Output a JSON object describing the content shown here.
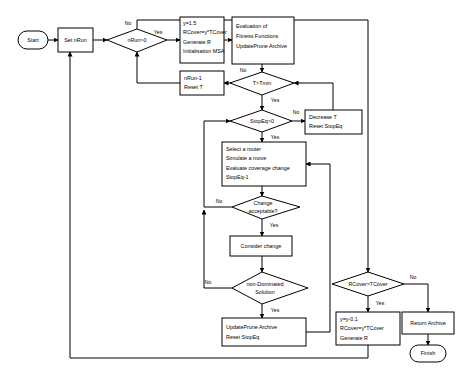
{
  "diagram": {
    "background_color": "#ffffff",
    "line_color": "#000000",
    "node_fill": "#ffffff",
    "nodes": {
      "start": {
        "label": "Start",
        "type": "terminator"
      },
      "set_nrun": {
        "label": "Set nRun",
        "type": "process"
      },
      "nrun_gt_0": {
        "label": "nRun>0",
        "type": "decision"
      },
      "init_box": {
        "type": "process",
        "lines": [
          "y=1.5",
          "RCover=y*TCover",
          "Generate R",
          "Initialisation MSA"
        ]
      },
      "eval_box": {
        "type": "process",
        "lines": [
          "Evaluation of",
          "Fitness Functions",
          "UpdatePrune Archive"
        ]
      },
      "nrun_dec": {
        "type": "process",
        "lines": [
          "nRun-1",
          "Reset T"
        ]
      },
      "t_gt_tmin": {
        "label": "T>Tmin",
        "type": "decision"
      },
      "decrease_t": {
        "type": "process",
        "lines": [
          "Decrease T",
          "Reset StopEq"
        ]
      },
      "stopeq_gt_0": {
        "label": "StopEq>0",
        "type": "decision"
      },
      "select_router": {
        "type": "process",
        "lines": [
          "Select a router",
          "Simulate a move",
          "Evaluate coverage change",
          "StopEq-1"
        ]
      },
      "change_acceptable": {
        "type": "decision",
        "lines": [
          "Change",
          "acceptable?"
        ]
      },
      "consider_change": {
        "label": "Consider change",
        "type": "process"
      },
      "non_dominated": {
        "type": "decision",
        "lines": [
          "non-Dominated",
          "Solution"
        ]
      },
      "update_prune": {
        "type": "process",
        "lines": [
          "UpdatePrune Archive",
          "Reset StopEq"
        ]
      },
      "rcover_gt_tcover": {
        "label": "RCover>TCover",
        "type": "decision"
      },
      "decrease_y": {
        "type": "process",
        "lines": [
          "y=y-0.1",
          "RCover=y*TCover",
          "Generate R"
        ]
      },
      "return_archive": {
        "label": "Return Archive",
        "type": "process"
      },
      "finish": {
        "label": "Finish",
        "type": "terminator"
      }
    },
    "edge_labels": {
      "nrun_no": "No",
      "nrun_yes": "Yes",
      "tmin_no": "No",
      "tmin_yes": "Yes",
      "stopeq_no": "No",
      "stopeq_yes": "Yes",
      "change_no": "No",
      "change_yes": "Yes",
      "nondom_no": "No",
      "nondom_yes": "Yes",
      "rcover_no": "No",
      "rcover_yes": "Yes"
    }
  }
}
